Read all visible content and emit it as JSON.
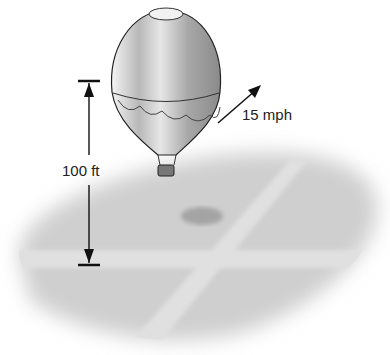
{
  "figure": {
    "height_label": "100 ft",
    "speed_label": "15 mph",
    "colors": {
      "ground": "#cfcfcf",
      "road": "#e2e2e2",
      "balloon_light": "#ececec",
      "balloon_dark": "#9a9a9a",
      "lines": "#222222",
      "shadow": "#a8a8a8"
    }
  }
}
